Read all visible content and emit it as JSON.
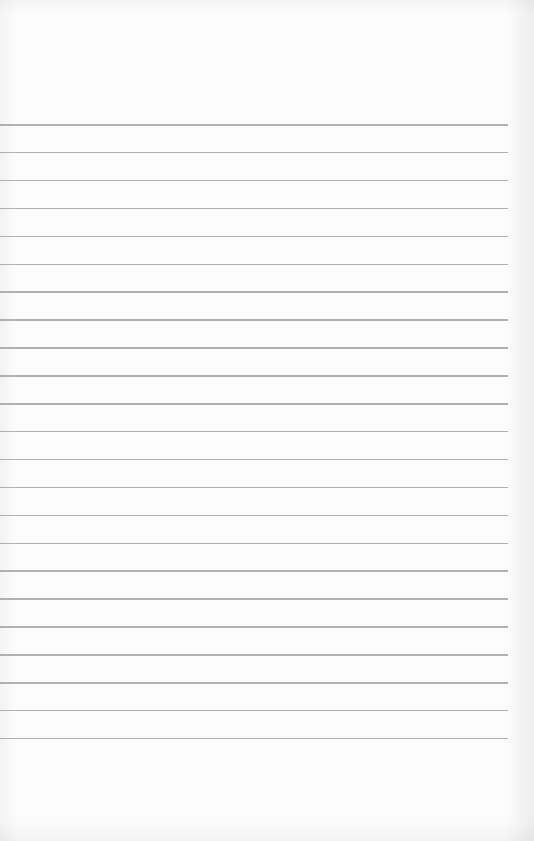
{
  "page": {
    "type": "blank lined paper",
    "background_color": "#fcfcfc",
    "line_color": "#a9a9a9",
    "line_count": 23,
    "first_line_y": 124,
    "line_spacing": 27.9,
    "line_left": 0,
    "line_right": 508
  }
}
